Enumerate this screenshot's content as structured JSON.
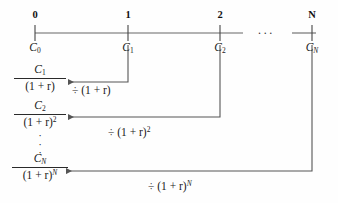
{
  "figure": {
    "type": "timeline-discounting-diagram",
    "line_color": "#555555",
    "text_color": "#1a1a1a",
    "background": "#fefefe"
  },
  "timeline": {
    "name": "cash-flow-timeline",
    "axis_y": 33,
    "ellipsis": "···",
    "ticks": [
      {
        "period": "0",
        "x": 35,
        "cash_flow_base": "C",
        "cash_flow_sub": "0",
        "cash_flow_text": "C0"
      },
      {
        "period": "1",
        "x": 128,
        "cash_flow_base": "C",
        "cash_flow_sub": "1",
        "cash_flow_text": "C1"
      },
      {
        "period": "2",
        "x": 220,
        "cash_flow_base": "C",
        "cash_flow_sub": "2",
        "cash_flow_text": "C2"
      },
      {
        "period": "N",
        "x": 312,
        "cash_flow_base": "C",
        "cash_flow_sub": "N",
        "cash_flow_text": "CN"
      }
    ]
  },
  "discount_rows": [
    {
      "name": "discount-row-1",
      "numerator_base": "C",
      "numerator_sub": "1",
      "denominator": "(1 + r)",
      "denominator_exp": "",
      "value_text": "C1/(1 + r)",
      "operation": "÷ (1 + r)",
      "operation_exp": "",
      "source_period": "1",
      "arrow_y": 82,
      "from_x": 128,
      "to_x": 62
    },
    {
      "name": "discount-row-2",
      "numerator_base": "C",
      "numerator_sub": "2",
      "denominator": "(1 + r)",
      "denominator_exp": "2",
      "value_text": "C2/(1 + r)^2",
      "operation": "÷ (1 + r)",
      "operation_exp": "2",
      "source_period": "2",
      "arrow_y": 117,
      "from_x": 220,
      "to_x": 62
    },
    {
      "name": "discount-row-n",
      "numerator_base": "C",
      "numerator_sub": "N",
      "denominator": "(1 + r)",
      "denominator_exp": "N",
      "value_text": "CN/(1 + r)^N",
      "operation": "÷ (1 + r)",
      "operation_exp": "N",
      "source_period": "N",
      "arrow_y": 171,
      "from_x": 312,
      "to_x": 60
    }
  ],
  "vertical_ellipsis": {
    "name": "vertical-ellipsis",
    "glyph": "·"
  }
}
